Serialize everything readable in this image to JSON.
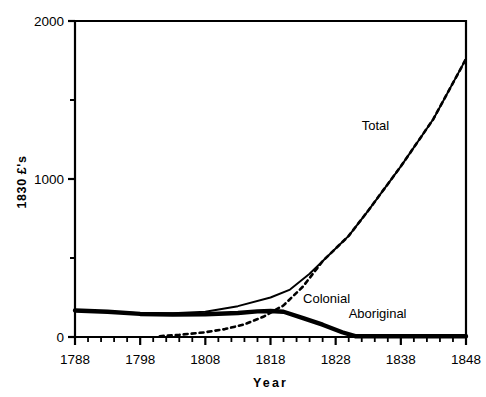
{
  "chart_data": {
    "type": "line",
    "title": "",
    "xlabel": "Year",
    "ylabel": "1830 £'s",
    "xlim": [
      1788,
      1848
    ],
    "ylim": [
      0,
      2000
    ],
    "xticks": [
      1788,
      1798,
      1808,
      1818,
      1828,
      1838,
      1848
    ],
    "xtick_labels": [
      "1788",
      "1798",
      "1808",
      "1818",
      "1828",
      "1838",
      "1848"
    ],
    "xminor_step": 2,
    "yticks": [
      0,
      1000,
      2000
    ],
    "ytick_labels": [
      "0",
      "1000",
      "2000"
    ],
    "yminor": [
      500,
      1500
    ],
    "grid": false,
    "legend_position": "inline-annotations",
    "series": [
      {
        "name": "Total",
        "style": "solid-thin",
        "label_x": 1832,
        "label_y": 1310,
        "x": [
          1788,
          1793,
          1798,
          1803,
          1808,
          1813,
          1818,
          1821,
          1824,
          1828,
          1830,
          1833,
          1838,
          1843,
          1848
        ],
        "y": [
          170,
          162,
          150,
          150,
          160,
          195,
          250,
          300,
          400,
          560,
          640,
          800,
          1080,
          1380,
          1760
        ]
      },
      {
        "name": "Colonial",
        "style": "dashed",
        "label_x": 1823,
        "label_y": 215,
        "x": [
          1801,
          1804,
          1808,
          1811,
          1814,
          1817,
          1820,
          1823,
          1826,
          1828,
          1830,
          1833,
          1838,
          1843,
          1848
        ],
        "y": [
          5,
          14,
          30,
          50,
          80,
          130,
          200,
          320,
          480,
          560,
          640,
          800,
          1080,
          1380,
          1760
        ]
      },
      {
        "name": "Aboriginal",
        "style": "solid-thick",
        "label_x": 1830,
        "label_y": 118,
        "x": [
          1788,
          1793,
          1798,
          1803,
          1808,
          1813,
          1816,
          1818,
          1820,
          1823,
          1826,
          1829,
          1831,
          1848
        ],
        "y": [
          168,
          160,
          146,
          142,
          144,
          152,
          162,
          165,
          160,
          120,
          78,
          30,
          5,
          5
        ]
      }
    ]
  },
  "axis": {
    "x_title": "Year",
    "y_title": "1830 £'s"
  },
  "colors": {
    "line": "#000000",
    "background": "#ffffff",
    "text": "#000000"
  }
}
